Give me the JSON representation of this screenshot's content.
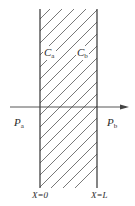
{
  "diagram": {
    "colors": {
      "line": "#333333",
      "hatch": "#555555",
      "background": "#ffffff"
    },
    "labels": {
      "ca_main": "C",
      "ca_sub": "a",
      "cb_main": "C",
      "cb_sub": "b",
      "pa_main": "P",
      "pa_sub": "a",
      "pb_main": "P",
      "pb_sub": "b",
      "x0": "X=0",
      "xl": "X=L"
    }
  }
}
